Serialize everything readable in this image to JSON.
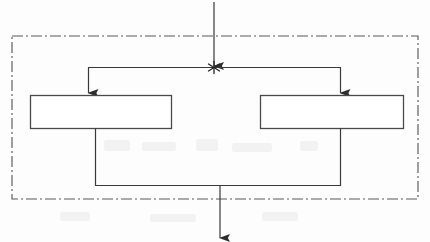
{
  "figure": {
    "type": "fork-join-block-diagram",
    "background_color": "#fdfdfd",
    "stroke_color": "#3a3a3a",
    "boundary_color": "#555555",
    "title": "",
    "caption": ""
  },
  "boundary": {
    "name": "enclosing-region",
    "label": "",
    "line_style": "dash-dot",
    "x": 12,
    "y": 36,
    "width": 406,
    "height": 163
  },
  "nodes": [
    {
      "id": "left-process",
      "label": "",
      "shape": "rectangle",
      "x": 30,
      "y": 95,
      "width": 141,
      "height": 33
    },
    {
      "id": "right-process",
      "label": "",
      "shape": "rectangle",
      "x": 260,
      "y": 95,
      "width": 143,
      "height": 33
    }
  ],
  "junctions": [
    {
      "id": "fork-point",
      "marker": "asterisk-star",
      "x": 214,
      "y": 67,
      "label": ""
    },
    {
      "id": "join-point",
      "marker": "none",
      "x": 220,
      "y": 185,
      "label": ""
    }
  ],
  "edges": [
    {
      "id": "input-edge",
      "from": "external-input",
      "to": "fork-point",
      "arrowhead": "filled-triangle",
      "label": ""
    },
    {
      "id": "fork-to-left",
      "from": "fork-point",
      "to": "left-process",
      "arrowhead": "filled-triangle",
      "label": ""
    },
    {
      "id": "fork-to-right",
      "from": "fork-point",
      "to": "right-process",
      "arrowhead": "filled-triangle",
      "label": ""
    },
    {
      "id": "left-to-join",
      "from": "left-process",
      "to": "join-point",
      "arrowhead": "none",
      "label": ""
    },
    {
      "id": "right-to-join",
      "from": "right-process",
      "to": "join-point",
      "arrowhead": "none",
      "label": ""
    },
    {
      "id": "output-edge",
      "from": "join-point",
      "to": "external-output",
      "arrowhead": "filled-triangle",
      "label": ""
    }
  ]
}
